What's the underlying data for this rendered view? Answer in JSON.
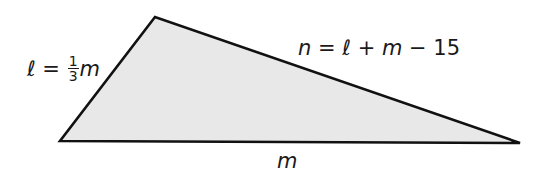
{
  "diagram": {
    "type": "triangle",
    "fill_color": "#e8e8e8",
    "stroke_color": "#111111",
    "vertices": {
      "top": [
        155,
        17
      ],
      "bottom_left": [
        60,
        141
      ],
      "bottom_right": [
        520,
        143
      ]
    },
    "labels": {
      "left_side": {
        "variable": "ℓ",
        "equals": " = ",
        "fraction_numerator": "1",
        "fraction_denominator": "3",
        "after_fraction": "m"
      },
      "top_side": {
        "variable": "n",
        "equals": " = ",
        "term1": "ℓ",
        "plus": " + ",
        "term2": "m",
        "minus": " − ",
        "constant": "15"
      },
      "bottom_side": {
        "variable": "m"
      }
    }
  }
}
